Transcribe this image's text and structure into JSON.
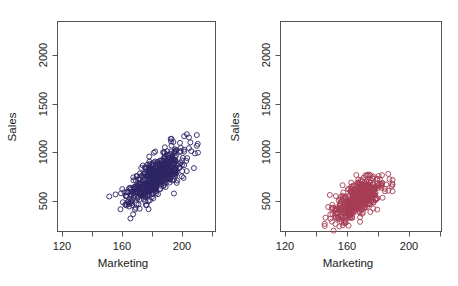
{
  "figure": {
    "background_color": "#ffffff",
    "width": 458,
    "height": 286,
    "panel_count": 2
  },
  "chart_data": [
    {
      "type": "scatter",
      "panel": "left",
      "title": "",
      "xlabel": "Marketing",
      "ylabel": "Sales",
      "xlim": [
        110,
        228
      ],
      "ylim": [
        330,
        2180
      ],
      "xticks": [
        120,
        140,
        160,
        180,
        200,
        220
      ],
      "xtick_labels": [
        "120",
        "",
        "160",
        "",
        "200",
        ""
      ],
      "yticks": [
        500,
        1000,
        1500,
        2000
      ],
      "ytick_labels": [
        "500",
        "1000",
        "1500",
        "2000"
      ],
      "grid": false,
      "legend": "none",
      "marker": "open-circle",
      "marker_color": "#2e2563",
      "marker_size": 4,
      "n_points": 520,
      "x_range_observed": [
        150,
        219
      ],
      "y_range_observed": [
        445,
        1225
      ],
      "x_mean": 183,
      "y_mean": 810,
      "x_sd": 11.5,
      "y_sd": 135,
      "correlation": 0.76
    },
    {
      "type": "scatter",
      "panel": "right",
      "title": "",
      "xlabel": "Marketing",
      "ylabel": "Sales",
      "xlim": [
        110,
        228
      ],
      "ylim": [
        330,
        2180
      ],
      "xticks": [
        120,
        140,
        160,
        180,
        200,
        220
      ],
      "xtick_labels": [
        "120",
        "",
        "160",
        "",
        "200",
        ""
      ],
      "yticks": [
        500,
        1000,
        1500,
        2000
      ],
      "ytick_labels": [
        "500",
        "1000",
        "1500",
        "2000"
      ],
      "grid": false,
      "legend": "none",
      "marker": "open-circle",
      "marker_color": "#a63c55",
      "marker_size": 4,
      "n_points": 520,
      "x_range_observed": [
        144,
        196
      ],
      "y_range_observed": [
        355,
        935
      ],
      "x_mean": 167,
      "y_mean": 620,
      "x_sd": 9.0,
      "y_sd": 95,
      "correlation": 0.66
    }
  ],
  "panels": [
    {
      "id": "left",
      "axis_color": "#555555",
      "ylabel": "Sales",
      "xlabel": "Marketing",
      "ytick_labels": [
        "500",
        "1000",
        "1500",
        "2000"
      ],
      "xtick_labels": [
        "120",
        "160",
        "200"
      ],
      "point_color": "#2e2563"
    },
    {
      "id": "right",
      "axis_color": "#555555",
      "ylabel": "Sales",
      "xlabel": "Marketing",
      "ytick_labels": [
        "500",
        "1000",
        "1500",
        "2000"
      ],
      "xtick_labels": [
        "120",
        "160",
        "200"
      ],
      "point_color": "#a63c55"
    }
  ]
}
